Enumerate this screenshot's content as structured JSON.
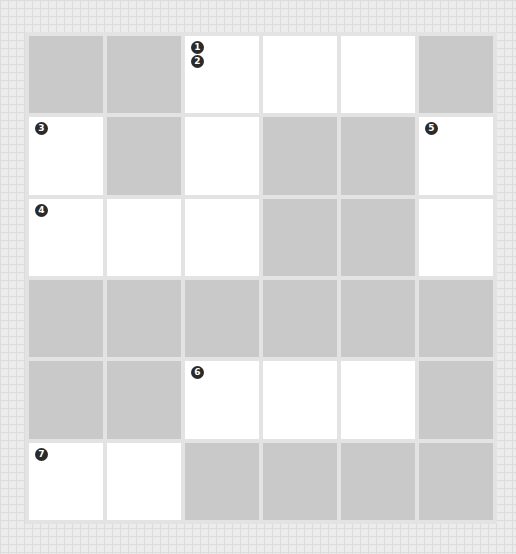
{
  "puzzle": {
    "rows": 6,
    "cols": 6,
    "colors": {
      "block": "#c9c9c9",
      "open": "#ffffff",
      "number_badge": "#2a2a2a"
    },
    "grid": [
      [
        {
          "type": "block"
        },
        {
          "type": "block"
        },
        {
          "type": "open",
          "numbers": [
            "1",
            "2"
          ]
        },
        {
          "type": "open"
        },
        {
          "type": "open"
        },
        {
          "type": "block"
        }
      ],
      [
        {
          "type": "open",
          "numbers": [
            "3"
          ]
        },
        {
          "type": "block"
        },
        {
          "type": "open"
        },
        {
          "type": "block"
        },
        {
          "type": "block"
        },
        {
          "type": "open",
          "numbers": [
            "5"
          ]
        }
      ],
      [
        {
          "type": "open",
          "numbers": [
            "4"
          ]
        },
        {
          "type": "open"
        },
        {
          "type": "open"
        },
        {
          "type": "block"
        },
        {
          "type": "block"
        },
        {
          "type": "open"
        }
      ],
      [
        {
          "type": "block"
        },
        {
          "type": "block"
        },
        {
          "type": "block"
        },
        {
          "type": "block"
        },
        {
          "type": "block"
        },
        {
          "type": "block"
        }
      ],
      [
        {
          "type": "block"
        },
        {
          "type": "block"
        },
        {
          "type": "open",
          "numbers": [
            "6"
          ]
        },
        {
          "type": "open"
        },
        {
          "type": "open"
        },
        {
          "type": "block"
        }
      ],
      [
        {
          "type": "open",
          "numbers": [
            "7"
          ]
        },
        {
          "type": "open"
        },
        {
          "type": "block"
        },
        {
          "type": "block"
        },
        {
          "type": "block"
        },
        {
          "type": "block"
        }
      ]
    ]
  }
}
